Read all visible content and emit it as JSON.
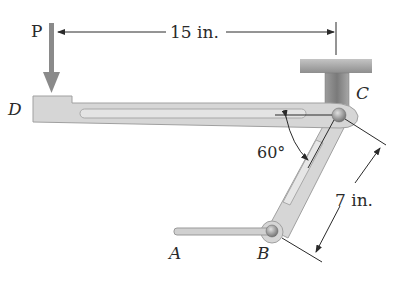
{
  "labels": {
    "force": "P",
    "point_a": "A",
    "point_b": "B",
    "point_c": "C",
    "point_d": "D",
    "dim_horizontal": "15 in.",
    "dim_link": "7 in.",
    "angle": "60°"
  },
  "colors": {
    "part_fill": "#d6d6d6",
    "part_stroke": "#9a9a9a",
    "support_fill": "#a9a9a9",
    "force_arrow": "#8a8a8a",
    "line": "#2a2a2a"
  }
}
